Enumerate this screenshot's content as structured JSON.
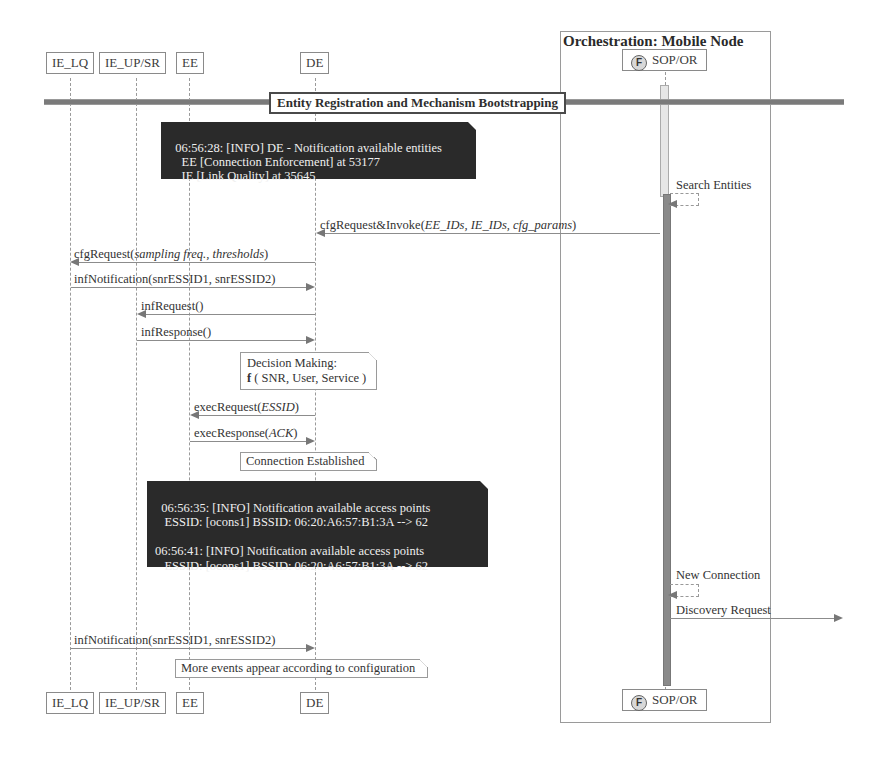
{
  "participants": [
    {
      "id": "ie_lq",
      "label": "IE_LQ"
    },
    {
      "id": "ie_up_sr",
      "label": "IE_UP/SR"
    },
    {
      "id": "ee",
      "label": "EE"
    },
    {
      "id": "de",
      "label": "DE"
    },
    {
      "id": "sop_or",
      "label": "SOP/OR",
      "icon": "F"
    }
  ],
  "group": {
    "title": "Orchestration: Mobile Node"
  },
  "divider": {
    "label": "Entity Registration and Mechanism Bootstrapping"
  },
  "notes": {
    "entities_log": "06:56:28: [INFO] DE - Notification available entities\n    EE [Connection Enforcement] at 53177\n    IE [Link Quality] at 35645",
    "decision_line1": "Decision Making:",
    "decision_line2_prefix": "f",
    "decision_line2_rest": " ( SNR, User, Service )",
    "connection_established": "Connection Established",
    "access_points_log": "06:56:35: [INFO] Notification available access points\n   ESSID: [ocons1] BSSID: 06:20:A6:57:B1:3A --> 62\n\n06:56:41: [INFO] Notification available access points\n   ESSID: [ocons1] BSSID: 06:20:A6:57:B1:3A --> 62",
    "more_events": "More events appear according to configuration"
  },
  "messages": [
    {
      "from": "SOP/OR",
      "to": "SOP/OR",
      "name": "Search Entities",
      "args": ""
    },
    {
      "from": "SOP/OR",
      "to": "DE",
      "name": "cfgRequest&Invoke(",
      "args": "EE_IDs, IE_IDs, cfg_params",
      "close": ")"
    },
    {
      "from": "DE",
      "to": "IE_LQ",
      "name": "cfgRequest(",
      "args": "sampling freq., thresholds",
      "close": ")"
    },
    {
      "from": "IE_LQ",
      "to": "DE",
      "name": "infNotification(snrESSID1, snrESSID2)",
      "args": ""
    },
    {
      "from": "DE",
      "to": "IE_UP/SR",
      "name": "infRequest()",
      "args": ""
    },
    {
      "from": "IE_UP/SR",
      "to": "DE",
      "name": "infResponse()",
      "args": ""
    },
    {
      "from": "DE",
      "to": "EE",
      "name": "execRequest(",
      "args": "ESSID",
      "close": ")"
    },
    {
      "from": "EE",
      "to": "DE",
      "name": "execResponse(",
      "args": "ACK",
      "close": ")"
    },
    {
      "from": "SOP/OR",
      "to": "SOP/OR",
      "name": "New Connection",
      "args": ""
    },
    {
      "from": "SOP/OR",
      "to": "external",
      "name": "Discovery Request",
      "args": ""
    },
    {
      "from": "IE_LQ",
      "to": "DE",
      "name": "infNotification(snrESSID1, snrESSID2)",
      "args": ""
    }
  ]
}
